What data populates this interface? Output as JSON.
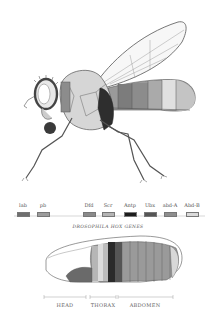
{
  "figure": {
    "caption": "DROSOPHILA HOX GENES",
    "genes": [
      {
        "label": "lab",
        "color": "#6f6f6f",
        "x": 23
      },
      {
        "label": "pb",
        "color": "#9c9c9c",
        "x": 43
      },
      {
        "label": "Dfd",
        "color": "#8a8a8a",
        "x": 89
      },
      {
        "label": "Scr",
        "color": "#b4b4b4",
        "x": 108
      },
      {
        "label": "Antp",
        "color": "#1c1c1c",
        "x": 130
      },
      {
        "label": "Ubx",
        "color": "#555555",
        "x": 150
      },
      {
        "label": "abd-A",
        "color": "#8e8e8e",
        "x": 170
      },
      {
        "label": "Abd-B",
        "color": "#dadada",
        "x": 192
      }
    ],
    "regions": [
      {
        "label": "HEAD",
        "x_start": 44,
        "x_end": 86
      },
      {
        "label": "THORAX",
        "x_start": 90,
        "x_end": 116
      },
      {
        "label": "ABDOMEN",
        "x_start": 118,
        "x_end": 173
      }
    ]
  }
}
